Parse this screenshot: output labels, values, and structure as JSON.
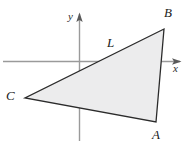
{
  "figure": {
    "background_color": "#ffffff"
  },
  "axes": {
    "x_axis": {
      "label": "x",
      "color": "#9a9a9a",
      "y_position": 61,
      "x_start": 3,
      "x_end": 181,
      "arrow": "right-arrow-icon"
    },
    "y_axis": {
      "label": "y",
      "color": "#9a9a9a",
      "x_position": 80,
      "y_start": 13,
      "y_end": 141,
      "arrow": "up-arrow-icon"
    },
    "origin": {
      "x": 80,
      "y": 61
    }
  },
  "triangle": {
    "name": "triangle-ABC",
    "fill_color": "#ececed",
    "stroke_color": "#2b2b2b",
    "stroke_width": 1.3,
    "points_path": "164,29 156,122 25,98",
    "vertices": [
      {
        "label": "B",
        "x": 164,
        "y": 29
      },
      {
        "label": "A",
        "x": 156,
        "y": 122
      },
      {
        "label": "C",
        "x": 25,
        "y": 98
      }
    ]
  },
  "line_label": {
    "label": "L",
    "describes_edge": "C-to-B"
  },
  "chart_data": {
    "type": "scatter",
    "xlabel": "x",
    "ylabel": "y",
    "grid": false,
    "legend": null,
    "annotations": [
      "A",
      "B",
      "C",
      "L",
      "x",
      "y"
    ],
    "series": [
      {
        "name": "triangle-ABC",
        "closed": true,
        "x": [
          164,
          156,
          25
        ],
        "y": [
          29,
          122,
          98
        ],
        "point_labels": [
          "B",
          "A",
          "C"
        ]
      }
    ]
  }
}
